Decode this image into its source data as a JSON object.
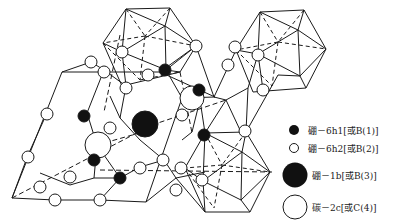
{
  "legend": {
    "items": [
      {
        "symbol": "small-filled-circle",
        "label": "硼－6h1[或B(1)]"
      },
      {
        "symbol": "small-open-circle",
        "label": "硼－6h2[或B(2)]"
      },
      {
        "symbol": "large-filled-circle",
        "label": "硼－1b[或B(3)]"
      },
      {
        "symbol": "large-open-circle",
        "label": "碳－2c[或C(4)]"
      }
    ]
  },
  "colors": {
    "line": "#1a1a1a",
    "fill_dark": "#111111",
    "fill_light": "#ffffff",
    "background": "#ffffff"
  }
}
